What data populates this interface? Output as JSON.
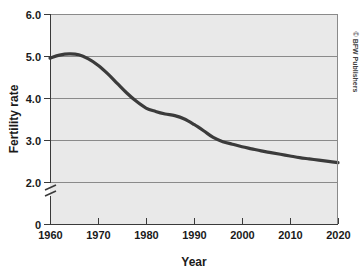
{
  "chart_data": {
    "type": "line",
    "title": "",
    "xlabel": "Year",
    "ylabel": "Fertility rate",
    "xlim": [
      1960,
      2020
    ],
    "ylim": [
      2.0,
      6.0
    ],
    "y_axis_break": true,
    "y_axis_break_note": "axis broken between 0 and 2.0",
    "grid": true,
    "grid_orientation": "horizontal",
    "legend": "none",
    "xticks": [
      1960,
      1970,
      1980,
      1990,
      2000,
      2010,
      2020
    ],
    "xtick_labels": [
      "1960",
      "1970",
      "1980",
      "1990",
      "2000",
      "2010",
      "2020"
    ],
    "yticks": [
      0,
      2.0,
      3.0,
      4.0,
      5.0,
      6.0
    ],
    "ytick_labels": [
      "0",
      "2.0",
      "3.0",
      "4.0",
      "5.0",
      "6.0"
    ],
    "series": [
      {
        "name": "World fertility rate",
        "x": [
          1960,
          1962,
          1964,
          1966,
          1968,
          1970,
          1972,
          1974,
          1976,
          1978,
          1980,
          1982,
          1984,
          1986,
          1988,
          1990,
          1992,
          1994,
          1996,
          1998,
          2000,
          2002,
          2004,
          2006,
          2008,
          2010,
          2012,
          2014,
          2016,
          2018,
          2020
        ],
        "values": [
          4.95,
          5.02,
          5.05,
          5.03,
          4.93,
          4.78,
          4.58,
          4.35,
          4.12,
          3.92,
          3.76,
          3.68,
          3.62,
          3.58,
          3.5,
          3.37,
          3.22,
          3.06,
          2.96,
          2.9,
          2.84,
          2.79,
          2.74,
          2.7,
          2.66,
          2.62,
          2.58,
          2.55,
          2.52,
          2.49,
          2.46
        ]
      }
    ],
    "annotations": []
  },
  "axis": {
    "y_title": "Fertility rate",
    "x_title": "Year"
  },
  "credit": {
    "text": "© BFW Publishers"
  },
  "colors": {
    "plot_background": "#e9e9e9",
    "line": "#3b3b3b",
    "gridline": "#8a8a8a",
    "axis": "#3a3a3a",
    "page_background": "#ffffff"
  }
}
